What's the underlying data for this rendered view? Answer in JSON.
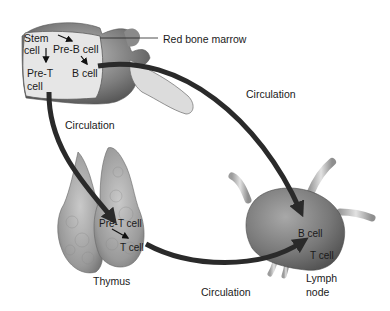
{
  "diagram": {
    "organs": {
      "bone_marrow": {
        "label": "Red bone marrow"
      },
      "thymus": {
        "label": "Thymus"
      },
      "lymph_node": {
        "label_line1": "Lymph",
        "label_line2": "node"
      }
    },
    "bone_marrow_cells": {
      "stem_line1": "Stem",
      "stem_line2": "cell",
      "pre_b": "Pre-B cell",
      "b": "B cell",
      "pre_t_line1": "Pre-T",
      "pre_t_line2": "cell"
    },
    "thymus_cells": {
      "pre_t": "Pre-T cell",
      "t": "T cell"
    },
    "lymph_node_cells": {
      "b": "B cell",
      "t": "T cell"
    },
    "pathways": [
      {
        "label": "Circulation",
        "from": "bone marrow (B cell)",
        "to": "lymph node (B cell)"
      },
      {
        "label": "Circulation",
        "from": "bone marrow (Pre-T cell)",
        "to": "thymus (Pre-T cell)"
      },
      {
        "label": "Circulation",
        "from": "thymus (T cell)",
        "to": "lymph node (T cell)"
      }
    ],
    "colors": {
      "arrow": "#2a2a2a",
      "tissue": "#8e8e8e",
      "marrow_fill": "#e6e6e6",
      "bone": "#7a7a7a"
    }
  }
}
